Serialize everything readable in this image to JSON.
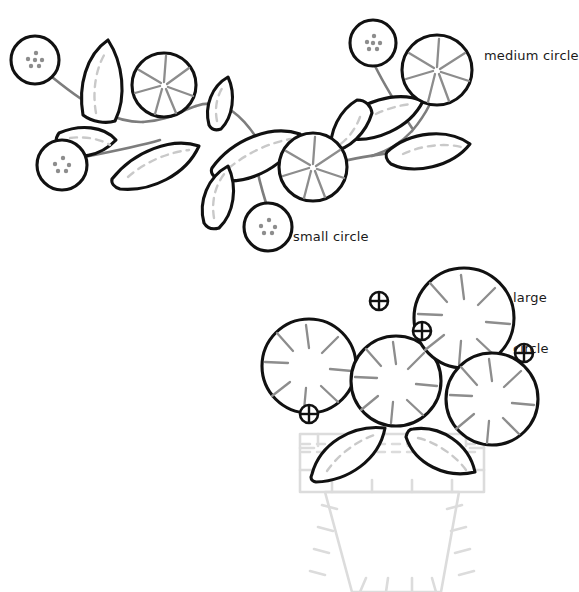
{
  "page": {
    "background_color": "#ffffff",
    "width": 573,
    "height": 592
  },
  "palette": {
    "ink": "#111111",
    "stem_gray": "#7d7d7d",
    "vein_gray": "#c9c9c9",
    "spoke_gray": "#8d8d8d",
    "pot_gray": "#dcdcdc",
    "paper": "#ffffff"
  },
  "labels": [
    {
      "id": "medium-circle",
      "text": "medium circle",
      "x": 484,
      "y": 48,
      "lines": [
        "medium circle"
      ]
    },
    {
      "id": "small-circle",
      "text": "small circle",
      "x": 293,
      "y": 229,
      "lines": [
        "small circle"
      ]
    },
    {
      "id": "large-circle",
      "text": "large circle",
      "x": 513,
      "y": 255,
      "lines": [
        "large",
        "circle"
      ]
    }
  ],
  "figures": [
    {
      "id": "vine-sprig",
      "name": "berry vine sprig",
      "description": "curving gray stem with leaves, dotted small circles and spoked medium circles",
      "counts": {
        "small_circles": 4,
        "medium_circles": 3,
        "leaves": 8,
        "stems": 5
      }
    },
    {
      "id": "flower-pot",
      "name": "flower pot bouquet",
      "description": "four large spoked circles over two leaves above a pale outlined pot with stitch ticks",
      "counts": {
        "large_circles": 4,
        "leaves": 2,
        "markers": 4,
        "pots": 1
      }
    }
  ],
  "shapes": {
    "small_circles": [
      {
        "cx": 35,
        "cy": 60,
        "r": 24
      },
      {
        "cx": 62,
        "cy": 165,
        "r": 25
      },
      {
        "cx": 268,
        "cy": 227,
        "r": 24
      },
      {
        "cx": 373,
        "cy": 43,
        "r": 23
      }
    ],
    "medium_circles": [
      {
        "cx": 164,
        "cy": 85,
        "r": 32
      },
      {
        "cx": 313,
        "cy": 167,
        "r": 34
      },
      {
        "cx": 437,
        "cy": 70,
        "r": 35
      }
    ],
    "large_circles": [
      {
        "cx": 309,
        "cy": 366,
        "r": 47
      },
      {
        "cx": 396,
        "cy": 381,
        "r": 45
      },
      {
        "cx": 464,
        "cy": 318,
        "r": 50
      },
      {
        "cx": 492,
        "cy": 399,
        "r": 46
      }
    ],
    "markers": [
      {
        "cx": 379,
        "cy": 301,
        "r": 9
      },
      {
        "cx": 422,
        "cy": 331,
        "r": 9
      },
      {
        "cx": 524,
        "cy": 353,
        "r": 9
      },
      {
        "cx": 309,
        "cy": 414,
        "r": 9
      }
    ]
  }
}
